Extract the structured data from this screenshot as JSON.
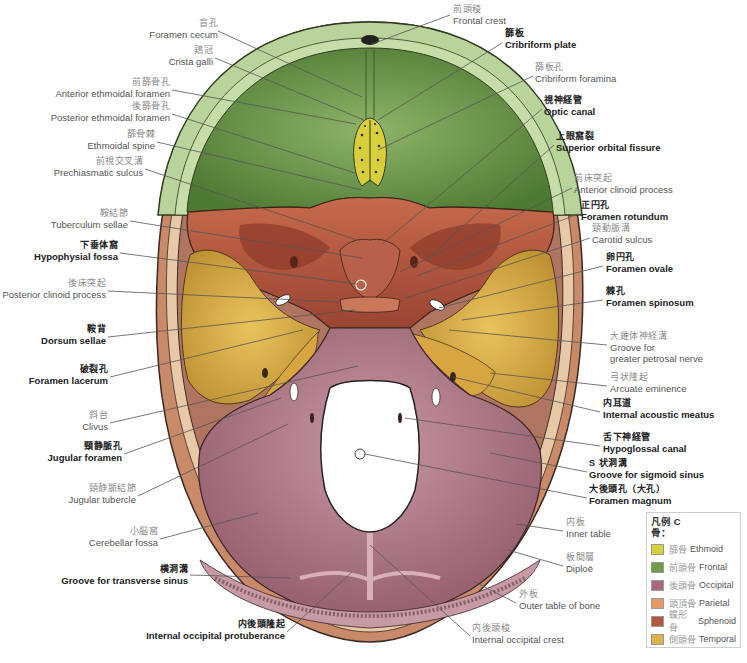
{
  "figure": {
    "colors": {
      "ethmoid": "#d8cf3a",
      "frontal": "#6f9a4a",
      "occipital": "#a86a78",
      "parietal": "#e69a66",
      "sphenoid": "#b4573f",
      "temporal": "#e0b04a",
      "bone_rim": "#d8a98a",
      "frontal_rim": "#b8d49a"
    }
  },
  "labels": [
    {
      "id": "foramen-cecum",
      "jp": "盲孔",
      "en": "Foramen cecum",
      "bold": false,
      "side": "right",
      "x": 138,
      "y": 18
    },
    {
      "id": "crista-galli",
      "jp": "鶏冠",
      "en": "Crista galli",
      "bold": false,
      "side": "right",
      "x": 176,
      "y": 45
    },
    {
      "id": "anterior-ethmoidal-foramen",
      "jp": "前篩骨孔",
      "en": "Anterior ethmoidal foramen",
      "bold": false,
      "side": "right",
      "x": 62,
      "y": 77
    },
    {
      "id": "posterior-ethmoidal-foramen",
      "jp": "後篩骨孔",
      "en": "Posterior ethmoidal foramen",
      "bold": false,
      "side": "right",
      "x": 58,
      "y": 101
    },
    {
      "id": "ethmoidal-spine",
      "jp": "篩骨棘",
      "en": "Ethmoidal spine",
      "bold": false,
      "side": "right",
      "x": 95,
      "y": 129
    },
    {
      "id": "prechiasmatic-sulcus",
      "jp": "前視交叉溝",
      "en": "Prechiasmatic sulcus",
      "bold": false,
      "side": "right",
      "x": 60,
      "y": 156
    },
    {
      "id": "tuberculum-sellae",
      "jp": "鞍結節",
      "en": "Tuberculum sellae",
      "bold": false,
      "side": "right",
      "x": 58,
      "y": 208
    },
    {
      "id": "hypophysial-fossa",
      "jp": "下垂体窩",
      "en": "Hypophysial fossa",
      "bold": true,
      "side": "right",
      "x": 38,
      "y": 240
    },
    {
      "id": "posterior-clinoid-process",
      "jp": "後床突起",
      "en": "Posterior clinoid process",
      "bold": false,
      "side": "right",
      "x": 10,
      "y": 278
    },
    {
      "id": "dorsum-sellae",
      "jp": "鞍背",
      "en": "Dorsum sellae",
      "bold": true,
      "side": "right",
      "x": 45,
      "y": 324
    },
    {
      "id": "foramen-lacerum",
      "jp": "破裂孔",
      "en": "Foramen lacerum",
      "bold": true,
      "side": "right",
      "x": 33,
      "y": 364
    },
    {
      "id": "clivus",
      "jp": "斜台",
      "en": "Clivus",
      "bold": false,
      "side": "right",
      "x": 82,
      "y": 410
    },
    {
      "id": "jugular-foramen",
      "jp": "頸静脈孔",
      "en": "Jugular foramen",
      "bold": true,
      "side": "right",
      "x": 54,
      "y": 441
    },
    {
      "id": "jugular-tubercle",
      "jp": "頸静脈結節",
      "en": "Jugular tubercle",
      "bold": false,
      "side": "right",
      "x": 74,
      "y": 483
    },
    {
      "id": "cerebellar-fossa",
      "jp": "小脳窩",
      "en": "Cerebellar fossa",
      "bold": false,
      "side": "right",
      "x": 97,
      "y": 526
    },
    {
      "id": "groove-transverse-sinus",
      "jp": "横洞溝",
      "en": "Groove for transverse sinus",
      "bold": true,
      "side": "right",
      "x": 72,
      "y": 564
    },
    {
      "id": "internal-occipital-protuberance",
      "jp": "内後頭隆起",
      "en": "Internal occipital protuberance",
      "bold": true,
      "side": "right",
      "x": 126,
      "y": 619
    },
    {
      "id": "frontal-crest",
      "jp": "前頭稜",
      "en": "Frontal crest",
      "bold": false,
      "side": "left",
      "x": 453,
      "y": 4
    },
    {
      "id": "cribriform-plate",
      "jp": "篩板",
      "en": "Cribriform plate",
      "bold": true,
      "side": "left",
      "x": 505,
      "y": 28
    },
    {
      "id": "cribriform-foramina",
      "jp": "篩板孔",
      "en": "Cribriform foramina",
      "bold": false,
      "side": "left",
      "x": 535,
      "y": 62
    },
    {
      "id": "optic-canal",
      "jp": "視神経管",
      "en": "Optic canal",
      "bold": true,
      "side": "left",
      "x": 544,
      "y": 95
    },
    {
      "id": "superior-orbital-fissure",
      "jp": "上眼窩裂",
      "en": "Superior orbital fissure",
      "bold": true,
      "side": "left",
      "x": 556,
      "y": 131
    },
    {
      "id": "anterior-clinoid-process",
      "jp": "前床突起",
      "en": "Anterior clinoid process",
      "bold": false,
      "side": "left",
      "x": 574,
      "y": 173
    },
    {
      "id": "foramen-rotundum",
      "jp": "正円孔",
      "en": "Foramen rotundum",
      "bold": true,
      "side": "left",
      "x": 581,
      "y": 200
    },
    {
      "id": "carotid-sulcus",
      "jp": "頸動脈溝",
      "en": "Carotid sulcus",
      "bold": false,
      "side": "left",
      "x": 592,
      "y": 223
    },
    {
      "id": "foramen-ovale",
      "jp": "卵円孔",
      "en": "Foramen ovale",
      "bold": true,
      "side": "left",
      "x": 606,
      "y": 252
    },
    {
      "id": "foramen-spinosum",
      "jp": "棘孔",
      "en": "Foramen spinosum",
      "bold": true,
      "side": "left",
      "x": 606,
      "y": 286
    },
    {
      "id": "groove-greater-petrosal-nerve",
      "jp": "大錐体神経溝",
      "en1": "Groove for",
      "en": "greater petrosal nerve",
      "bold": false,
      "side": "left",
      "x": 610,
      "y": 331
    },
    {
      "id": "arcuate-eminence",
      "jp": "弓状隆起",
      "en": "Arcuate eminence",
      "bold": false,
      "side": "left",
      "x": 610,
      "y": 372
    },
    {
      "id": "internal-acoustic-meatus",
      "jp": "内耳道",
      "en": "Internal acoustic meatus",
      "bold": true,
      "side": "left",
      "x": 603,
      "y": 398
    },
    {
      "id": "hypoglossal-canal",
      "jp": "舌下神経管",
      "en": "Hypoglossal canal",
      "bold": true,
      "side": "left",
      "x": 603,
      "y": 432
    },
    {
      "id": "groove-sigmoid-sinus",
      "jp": "S 状洞溝",
      "en": "Groove for sigmoid sinus",
      "bold": true,
      "side": "left",
      "x": 589,
      "y": 458
    },
    {
      "id": "foramen-magnum",
      "jp": "大後頭孔（大孔）",
      "en": "Foramen magnum",
      "bold": true,
      "side": "left",
      "x": 589,
      "y": 484
    },
    {
      "id": "inner-table",
      "jp": "内板",
      "en": "Inner table",
      "bold": false,
      "side": "left",
      "x": 566,
      "y": 517
    },
    {
      "id": "diploe",
      "jp": "板間層",
      "en": "Diploë",
      "bold": false,
      "side": "left",
      "x": 566,
      "y": 552
    },
    {
      "id": "outer-table",
      "jp": "外板",
      "en": "Outer table of bone",
      "bold": false,
      "side": "left",
      "x": 519,
      "y": 589
    },
    {
      "id": "internal-occipital-crest",
      "jp": "内後頭稜",
      "en": "Internal occipital crest",
      "bold": false,
      "side": "left",
      "x": 472,
      "y": 623
    }
  ],
  "legend": {
    "title": "凡例 C",
    "subtitle": "骨：",
    "items": [
      {
        "jp": "篩骨",
        "en": "Ethmoid",
        "color": "#d8cf3a"
      },
      {
        "jp": "前頭骨",
        "en": "Frontal",
        "color": "#6f9a4a"
      },
      {
        "jp": "後頭骨",
        "en": "Occipital",
        "color": "#a86a78"
      },
      {
        "jp": "頭頂骨",
        "en": "Parietal",
        "color": "#e69a66"
      },
      {
        "jp": "蝶形骨",
        "en": "Sphenoid",
        "color": "#b4573f"
      },
      {
        "jp": "側頭骨",
        "en": "Temporal",
        "color": "#e0b04a"
      }
    ]
  }
}
